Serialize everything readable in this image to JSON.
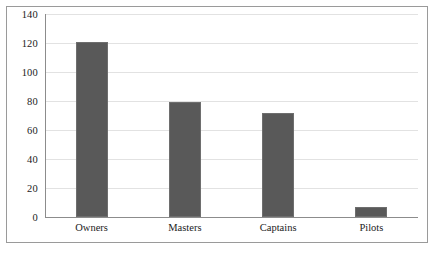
{
  "chart_data": {
    "type": "bar",
    "title": "",
    "subtitle": "",
    "xlabel": "",
    "ylabel": "",
    "categories": [
      "Owners",
      "Masters",
      "Captains",
      "Pilots"
    ],
    "values": [
      121,
      79,
      72,
      7
    ],
    "ylim": [
      0,
      140
    ],
    "ytick_labels": [
      "0",
      "20",
      "40",
      "60",
      "80",
      "100",
      "120",
      "140"
    ],
    "ytick_values": [
      0,
      20,
      40,
      60,
      80,
      100,
      120,
      140
    ],
    "grid": true,
    "grid_axis": "y",
    "legend": false,
    "legend_position": "none",
    "annotations": [],
    "colors": {
      "bar_fill": "#595959",
      "bar_edge": "#6e6e6e",
      "gridline": "#e2e2e2",
      "axis": "#8c8c8c",
      "frame": "#9a9a9a",
      "background": "#ffffff",
      "text": "#1b1b1b"
    }
  }
}
